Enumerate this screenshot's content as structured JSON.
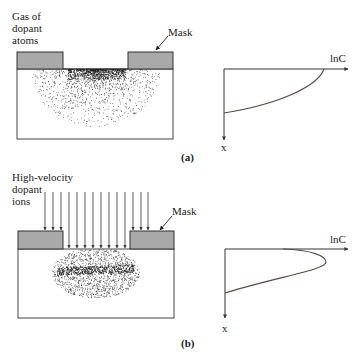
{
  "figure": {
    "panel_a": {
      "caption": "(a)",
      "source_label": "Gas of\ndopant\natoms",
      "mask_label": "Mask",
      "graph": {
        "x_axis_label": "lnC",
        "y_axis_label": "x",
        "profile": "monotonically decreasing (diffusion)"
      }
    },
    "panel_b": {
      "caption": "(b)",
      "source_label": "High-velocity\ndopant\nions",
      "mask_label": "Mask",
      "graph": {
        "x_axis_label": "lnC",
        "y_axis_label": "x",
        "profile": "peak below surface (implantation)"
      }
    },
    "colors": {
      "mask_fill": "#a9a9a9",
      "outline": "#333333",
      "curve": "#5a4a42",
      "dots": "#222222"
    }
  }
}
